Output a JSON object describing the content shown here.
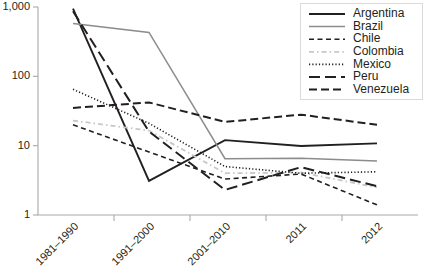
{
  "chart_data": {
    "type": "line",
    "title": "",
    "subtitle": "",
    "xlabel": "",
    "ylabel": "",
    "yscale": "log",
    "ylim": [
      1,
      1000
    ],
    "ytick_values": [
      1,
      10,
      100,
      1000
    ],
    "ytick_labels": [
      "1",
      "10",
      "100",
      "1,000"
    ],
    "grid": false,
    "legend_position": "top-right",
    "categories": [
      "1981–1990",
      "1991–2000",
      "2001–2010",
      "2011",
      "2012"
    ],
    "series": [
      {
        "name": "Argentina",
        "color": "#231f20",
        "style": "solid",
        "dash": "none",
        "width": 1.9,
        "values": [
          950,
          3.1,
          12,
          9.9,
          10.8
        ]
      },
      {
        "name": "Brazil",
        "color": "#8c8c8c",
        "style": "solid",
        "dash": "none",
        "width": 1.5,
        "values": [
          580,
          430,
          6.5,
          6.6,
          6.0
        ]
      },
      {
        "name": "Chile",
        "color": "#231f20",
        "style": "dashed",
        "dash": "5,3.5",
        "width": 1.6,
        "values": [
          20,
          8.1,
          3.3,
          3.9,
          1.4
        ]
      },
      {
        "name": "Colombia",
        "color": "#c7c8ca",
        "style": "dash-dot",
        "dash": "5,3,1.6,3",
        "width": 1.8,
        "values": [
          23,
          16.5,
          4.0,
          4.1,
          2.5
        ]
      },
      {
        "name": "Mexico",
        "color": "#231f20",
        "style": "dotted",
        "dash": "1.2,2.1",
        "width": 1.6,
        "values": [
          65,
          21,
          5.0,
          4.0,
          4.2
        ]
      },
      {
        "name": "Peru",
        "color": "#231f20",
        "style": "long-dash",
        "dash": "11,5",
        "width": 2.0,
        "values": [
          870,
          16.0,
          2.3,
          4.9,
          2.6
        ]
      },
      {
        "name": "Venezuela",
        "color": "#231f20",
        "style": "medium-dash",
        "dash": "8,4",
        "width": 2.0,
        "values": [
          35,
          42,
          22,
          28,
          20
        ]
      }
    ]
  },
  "legend": {
    "entries": [
      {
        "label": "Argentina"
      },
      {
        "label": "Brazil"
      },
      {
        "label": "Chile"
      },
      {
        "label": "Colombia"
      },
      {
        "label": "Mexico"
      },
      {
        "label": "Peru"
      },
      {
        "label": "Venezuela"
      }
    ]
  }
}
